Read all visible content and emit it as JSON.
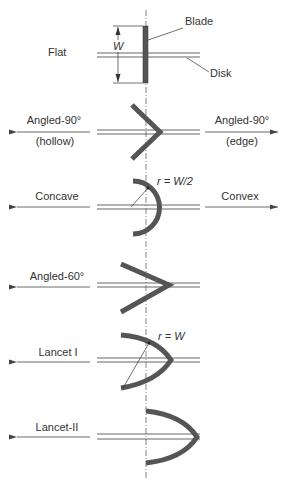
{
  "diagram": {
    "type": "impeller-blade-shapes",
    "colors": {
      "blade": "#555555",
      "line": "#444444",
      "text": "#333333",
      "background": "#ffffff"
    },
    "flat": {
      "label": "Flat",
      "dimension_label": "W",
      "blade_callout": "Blade",
      "disk_callout": "Disk"
    },
    "angled90": {
      "left_label_line1": "Angled-90°",
      "left_label_line2": "(hollow)",
      "right_label_line1": "Angled-90°",
      "right_label_line2": "(edge)"
    },
    "curved": {
      "left_label": "Concave",
      "right_label": "Convex",
      "radius_label": "r = W/2"
    },
    "angled60": {
      "label": "Angled-60°"
    },
    "lancet1": {
      "label": "Lancet I",
      "radius_label": "r = W"
    },
    "lancet2": {
      "label": "Lancet-II"
    }
  }
}
